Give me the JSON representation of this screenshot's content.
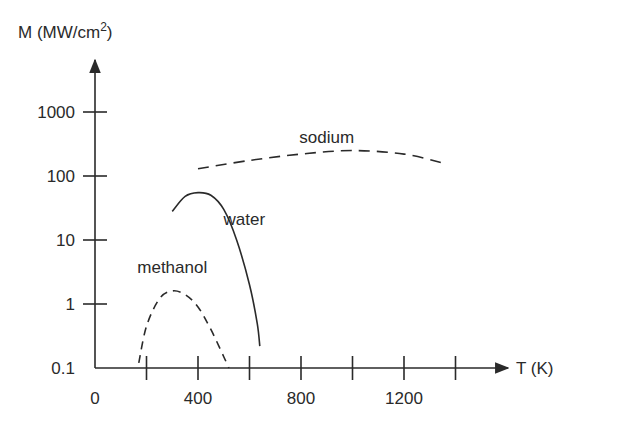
{
  "chart_data": {
    "type": "line",
    "title": "",
    "xlabel": "T (K)",
    "ylabel": "M (MW/cm²)",
    "ylabel_parts": {
      "main": "M (MW/cm",
      "sup": "2",
      "end": ")"
    },
    "yscale": "log",
    "xlim": [
      0,
      1500
    ],
    "ylim": [
      0.1,
      1000
    ],
    "x_ticks": [
      200,
      400,
      600,
      800,
      1000,
      1200,
      1400
    ],
    "x_tick_labels": [
      {
        "value": 0,
        "label": "0"
      },
      {
        "value": 400,
        "label": "400"
      },
      {
        "value": 800,
        "label": "800"
      },
      {
        "value": 1200,
        "label": "1200"
      }
    ],
    "y_tick_labels": [
      {
        "value": 1000,
        "label": "1000"
      },
      {
        "value": 100,
        "label": "100"
      },
      {
        "value": 10,
        "label": "10"
      },
      {
        "value": 1,
        "label": "1"
      },
      {
        "value": 0.1,
        "label": "0.1"
      }
    ],
    "grid": false,
    "legend": "none (curves labeled inline)",
    "series": [
      {
        "name": "methanol",
        "style": "dashed",
        "x": [
          170,
          200,
          250,
          300,
          350,
          400,
          450,
          500,
          520
        ],
        "y": [
          0.12,
          0.45,
          1.2,
          1.6,
          1.4,
          0.9,
          0.4,
          0.15,
          0.1
        ]
      },
      {
        "name": "water",
        "style": "solid",
        "x": [
          300,
          350,
          400,
          450,
          500,
          550,
          600,
          630,
          640
        ],
        "y": [
          28,
          48,
          55,
          50,
          30,
          10,
          2,
          0.5,
          0.22
        ]
      },
      {
        "name": "sodium",
        "style": "dashed",
        "x": [
          400,
          600,
          800,
          1000,
          1200,
          1350
        ],
        "y": [
          130,
          175,
          220,
          250,
          220,
          160
        ]
      }
    ],
    "annotations": [
      {
        "text": "methanol",
        "x": 300,
        "y": 3
      },
      {
        "text": "water",
        "x": 580,
        "y": 17
      },
      {
        "text": "sodium",
        "x": 900,
        "y": 330
      }
    ]
  }
}
